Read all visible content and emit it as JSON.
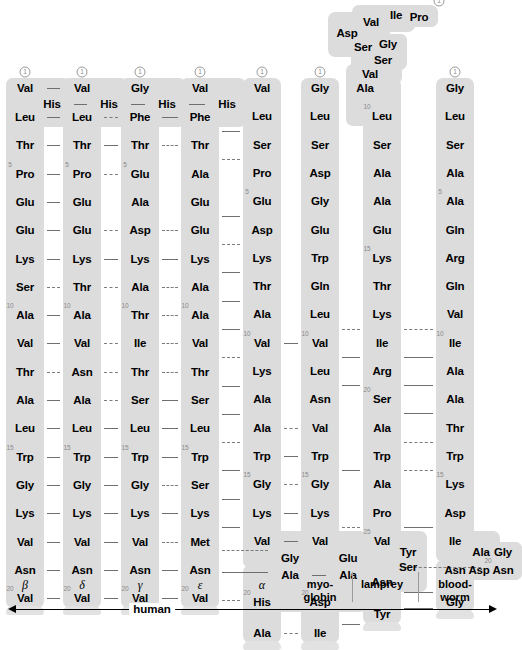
{
  "figure": {
    "start_marker": "1",
    "colors": {
      "ribbon": "#dcdcdc",
      "link": "#6f6f6f",
      "number": "#8a8a8a",
      "text": "#000000"
    }
  },
  "axis": {
    "label": "human",
    "style": "double-arrow"
  },
  "columns": [
    {
      "id": "beta",
      "label": "β",
      "label_kind": "greek",
      "x": 25,
      "start_number": 1,
      "residues": [
        "Val",
        "His",
        "Leu",
        "Thr",
        "Pro",
        "Glu",
        "Glu",
        "Lys",
        "Ser",
        "Ala",
        "Val",
        "Thr",
        "Ala",
        "Leu",
        "Trp",
        "Gly",
        "Lys",
        "Val",
        "Asn",
        "Val"
      ],
      "numbered": {
        "5": 5,
        "10": 10,
        "15": 15,
        "20": 20
      },
      "kinked_at": [
        2
      ]
    },
    {
      "id": "delta",
      "label": "δ",
      "label_kind": "greek",
      "x": 82,
      "start_number": 1,
      "residues": [
        "Val",
        "His",
        "Leu",
        "Thr",
        "Pro",
        "Glu",
        "Glu",
        "Lys",
        "Thr",
        "Ala",
        "Val",
        "Asn",
        "Ala",
        "Leu",
        "Trp",
        "Gly",
        "Lys",
        "Val",
        "Asn",
        "Val"
      ],
      "numbered": {
        "5": 5,
        "10": 10,
        "15": 15,
        "20": 20
      },
      "kinked_at": [
        2
      ]
    },
    {
      "id": "gamma",
      "label": "γ",
      "label_kind": "greek",
      "x": 140,
      "start_number": 1,
      "residues": [
        "Gly",
        "His",
        "Phe",
        "Thr",
        "Glu",
        "Ala",
        "Asp",
        "Lys",
        "Ala",
        "Thr",
        "Ile",
        "Thr",
        "Ser",
        "Leu",
        "Trp",
        "Gly",
        "Lys",
        "Val",
        "Asn",
        "Val"
      ],
      "numbered": {
        "5": 5,
        "10": 10,
        "15": 15,
        "20": 20
      },
      "kinked_at": [
        2
      ]
    },
    {
      "id": "epsilon",
      "label": "ε",
      "label_kind": "greek",
      "x": 200,
      "start_number": 1,
      "residues": [
        "Val",
        "His",
        "Phe",
        "Thr",
        "Ala",
        "Glu",
        "Glu",
        "Lys",
        "Ala",
        "Ala",
        "Val",
        "Thr",
        "Ser",
        "Leu",
        "Trp",
        "Ser",
        "Lys",
        "Met",
        "Asn",
        "Val"
      ],
      "numbered": {
        "10": 10,
        "15": 15,
        "20": 20
      },
      "kinked_at": [
        2
      ]
    },
    {
      "id": "alpha",
      "label": "α",
      "label_kind": "greek",
      "x": 262,
      "start_number": 1,
      "residues": [
        "Val",
        "Leu",
        "Ser",
        "Pro",
        "Glu",
        "Asp",
        "Lys",
        "Thr",
        "Ala",
        "Val",
        "Lys",
        "Ala",
        "Ala",
        "Trp",
        "Gly",
        "Lys",
        "Val",
        "Gly",
        "Ala",
        "His",
        "Ala"
      ],
      "numbered": {
        "5": 5,
        "10": 10,
        "15": 15,
        "20": 20
      },
      "kinked_at": [
        18
      ]
    },
    {
      "id": "myoglobin",
      "label": "myo-\nglobin",
      "label_kind": "plain",
      "x": 320,
      "start_number": 1,
      "residues": [
        "Gly",
        "Leu",
        "Ser",
        "Asp",
        "Gly",
        "Glu",
        "Trp",
        "Gln",
        "Leu",
        "Val",
        "Leu",
        "Asn",
        "Val",
        "Trp",
        "Gly",
        "Lys",
        "Val",
        "Glu",
        "Ala",
        "Asp",
        "Ile"
      ],
      "numbered": {
        "10": 10,
        "15": 15,
        "20": 20
      },
      "kinked_at": [
        18
      ]
    },
    {
      "id": "lamprey",
      "label": "lamprey",
      "label_kind": "plain",
      "x": 382,
      "start_number": 1,
      "residues": [
        "Pro",
        "Ile",
        "Val",
        "Asp",
        "Ser",
        "Gly",
        "Ser",
        "Val",
        "Ala",
        "Leu",
        "Ser",
        "Ala",
        "Ala",
        "Glu",
        "Lys",
        "Thr",
        "Lys",
        "Ile",
        "Arg",
        "Ser",
        "Ala",
        "Trp",
        "Ala",
        "Pro",
        "Val",
        "Tyr",
        "Ser",
        "Asn",
        "Tyr"
      ],
      "numbered": {
        "10": 10,
        "15": 15,
        "20": 20,
        "25": 25,
        "30": 30
      },
      "kinked_at": [
        1,
        25
      ]
    },
    {
      "id": "bloodworm",
      "label": "blood-\nworm",
      "label_kind": "plain",
      "x": 455,
      "start_number": 1,
      "residues": [
        "Gly",
        "Leu",
        "Ser",
        "Ala",
        "Ala",
        "Gln",
        "Arg",
        "Gln",
        "Val",
        "Ile",
        "Ala",
        "Ala",
        "Thr",
        "Trp",
        "Lys",
        "Asp",
        "Ile",
        "Ala",
        "Gly",
        "Asn",
        "Asp",
        "Asn",
        "Gly"
      ],
      "numbered": {
        "5": 5,
        "10": 10,
        "15": 15,
        "20": 20
      },
      "kinked_at": [
        17
      ]
    }
  ]
}
